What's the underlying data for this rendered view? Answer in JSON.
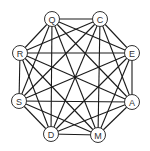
{
  "diagram": {
    "type": "complete-graph",
    "colors": {
      "edge": "#1a1a1a",
      "node_stroke": "#333333",
      "node_fill": "#ffffff",
      "label": "#333333"
    },
    "node_radius": 7.5,
    "nodes": [
      {
        "id": "Q",
        "label": "Q",
        "x": 52,
        "y": 19
      },
      {
        "id": "C",
        "label": "C",
        "x": 100,
        "y": 19
      },
      {
        "id": "E",
        "label": "E",
        "x": 132,
        "y": 53
      },
      {
        "id": "A",
        "label": "A",
        "x": 132,
        "y": 102
      },
      {
        "id": "M",
        "label": "M",
        "x": 98,
        "y": 135
      },
      {
        "id": "D",
        "label": "D",
        "x": 51,
        "y": 134
      },
      {
        "id": "S",
        "label": "S",
        "x": 19,
        "y": 101
      },
      {
        "id": "R",
        "label": "R",
        "x": 20,
        "y": 53
      }
    ],
    "edges": "all-pairs"
  }
}
